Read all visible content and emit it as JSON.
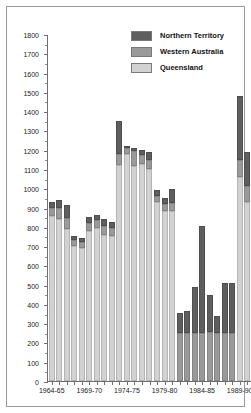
{
  "chart_data": {
    "type": "bar",
    "stacked": true,
    "title": "",
    "xlabel": "",
    "ylabel": "",
    "ylim": [
      0,
      1800
    ],
    "ytick_step": 100,
    "yticks": [
      0,
      100,
      200,
      300,
      400,
      500,
      600,
      700,
      800,
      900,
      1000,
      1100,
      1200,
      1300,
      1400,
      1500,
      1600,
      1700,
      1800
    ],
    "grid": false,
    "legend_position": "top-right",
    "categories": [
      "1964-65",
      "1965-66",
      "1966-67",
      "1967-68",
      "1968-69",
      "1969-70",
      "1970-71",
      "1971-72",
      "1972-73",
      "1973-74",
      "1974-75",
      "1975-76",
      "1976-77",
      "1977-78",
      "1978-79",
      "1979-80",
      "1980-81",
      "1981-82",
      "1982-83",
      "1983-84",
      "1984-85",
      "1985-86",
      "1986-87",
      "1987-88",
      "1988-89",
      "1989-90",
      "1990-91"
    ],
    "tick_labels": [
      "1964-65",
      "1969-70",
      "1974-75",
      "1979-80",
      "1984-85",
      "1989-90"
    ],
    "tick_label_indices": [
      0,
      5,
      10,
      15,
      20,
      25
    ],
    "series": [
      {
        "name": "Queensland",
        "color": "#d2d2d2",
        "values": [
          855,
          840,
          790,
          700,
          690,
          780,
          795,
          760,
          750,
          1120,
          1180,
          1115,
          1125,
          1100,
          930,
          880,
          880,
          0,
          0,
          0,
          0,
          0,
          0,
          0,
          0,
          1060,
          930
        ]
      },
      {
        "name": "Western Australia",
        "color": "#9a9a9a",
        "values": [
          45,
          60,
          55,
          30,
          30,
          40,
          40,
          45,
          45,
          60,
          30,
          80,
          45,
          45,
          30,
          40,
          45,
          250,
          250,
          250,
          250,
          255,
          250,
          250,
          250,
          85,
          80
        ]
      },
      {
        "name": "Northern Territory",
        "color": "#5e5e5e",
        "values": [
          30,
          40,
          70,
          20,
          20,
          30,
          25,
          35,
          30,
          170,
          10,
          15,
          30,
          45,
          30,
          30,
          70,
          105,
          115,
          240,
          555,
          190,
          85,
          260,
          260,
          335,
          180
        ]
      }
    ],
    "totals": [
      930,
      940,
      915,
      750,
      740,
      850,
      860,
      840,
      825,
      1350,
      1220,
      1210,
      1200,
      1190,
      990,
      950,
      995,
      355,
      365,
      490,
      805,
      445,
      335,
      510,
      510,
      1480,
      1190
    ]
  },
  "legend": {
    "items": [
      {
        "label": "Northern Territory",
        "color": "#5e5e5e"
      },
      {
        "label": "Western Australia",
        "color": "#9a9a9a"
      },
      {
        "label": "Queensland",
        "color": "#d2d2d2"
      }
    ]
  }
}
